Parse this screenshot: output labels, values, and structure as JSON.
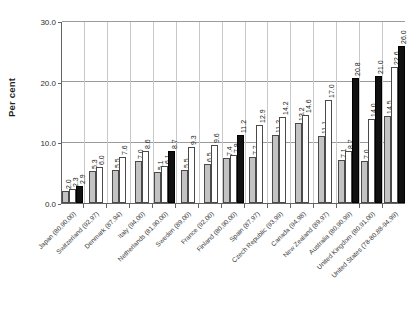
{
  "chart_data": {
    "type": "bar",
    "title": "",
    "xlabel": "",
    "ylabel": "Per cent",
    "ylim": [
      0,
      30
    ],
    "yticks": [
      "0.0",
      "10.0",
      "20.0",
      "30.0"
    ],
    "grid": true,
    "legend": "none",
    "categories": [
      "Japan (80,90,00)",
      "Switzerland (92,97)",
      "Denmark (87,94)",
      "Italy (94,00)",
      "Netherlands (81,90,00)",
      "Sweden (89,00)",
      "France (92,00)",
      "Finland (80,90,00)",
      "Spain (87,97)",
      "Czech Republic (93,99)",
      "Canada (94,98)",
      "New Zealand (89,97)",
      "Australia (80,90,99)",
      "United Kingdom (80,91,00)",
      "United States (78-80,88-94,99)"
    ],
    "groups": [
      {
        "category": "Japan (80,90,00)",
        "bars": [
          {
            "style": "gray",
            "value": 2.0
          },
          {
            "style": "white",
            "value": 2.3
          },
          {
            "style": "black",
            "value": 2.9
          }
        ]
      },
      {
        "category": "Switzerland (92,97)",
        "bars": [
          {
            "style": "gray",
            "value": 5.3
          },
          {
            "style": "white",
            "value": 6.0
          }
        ]
      },
      {
        "category": "Denmark (87,94)",
        "bars": [
          {
            "style": "gray",
            "value": 5.5
          },
          {
            "style": "white",
            "value": 7.6
          }
        ]
      },
      {
        "category": "Italy (94,00)",
        "bars": [
          {
            "style": "gray",
            "value": 7.0
          },
          {
            "style": "white",
            "value": 8.6
          }
        ]
      },
      {
        "category": "Netherlands (81,90,00)",
        "bars": [
          {
            "style": "gray",
            "value": 5.1
          },
          {
            "style": "white",
            "value": 6.1
          },
          {
            "style": "black",
            "value": 8.7
          }
        ]
      },
      {
        "category": "Sweden (89,00)",
        "bars": [
          {
            "style": "gray",
            "value": 5.5
          },
          {
            "style": "white",
            "value": 9.3
          }
        ]
      },
      {
        "category": "France (92,00)",
        "bars": [
          {
            "style": "gray",
            "value": 6.5
          },
          {
            "style": "white",
            "value": 9.6
          }
        ]
      },
      {
        "category": "Finland (80,90,00)",
        "bars": [
          {
            "style": "gray",
            "value": 7.4
          },
          {
            "style": "white",
            "value": 7.9
          },
          {
            "style": "black",
            "value": 11.2
          }
        ]
      },
      {
        "category": "Spain (87,97)",
        "bars": [
          {
            "style": "gray",
            "value": 7.7
          },
          {
            "style": "white",
            "value": 12.9
          }
        ]
      },
      {
        "category": "Czech Republic (93,99)",
        "bars": [
          {
            "style": "gray",
            "value": 11.2
          },
          {
            "style": "white",
            "value": 14.2
          }
        ]
      },
      {
        "category": "Canada (94,98)",
        "bars": [
          {
            "style": "gray",
            "value": 13.2
          },
          {
            "style": "white",
            "value": 14.6
          }
        ]
      },
      {
        "category": "New Zealand (89,97)",
        "bars": [
          {
            "style": "gray",
            "value": 11.1
          },
          {
            "style": "white",
            "value": 17.0
          }
        ]
      },
      {
        "category": "Australia (80,90,99)",
        "bars": [
          {
            "style": "gray",
            "value": 7.1
          },
          {
            "style": "white",
            "value": 8.7
          },
          {
            "style": "black",
            "value": 20.8
          }
        ]
      },
      {
        "category": "United Kingdom (80,91,00)",
        "bars": [
          {
            "style": "gray",
            "value": 7.0
          },
          {
            "style": "white",
            "value": 14.0
          },
          {
            "style": "black",
            "value": 21.0
          }
        ]
      },
      {
        "category": "United States (78-80,88-94,99)",
        "bars": [
          {
            "style": "gray",
            "value": 14.5
          },
          {
            "style": "white",
            "value": 22.6
          },
          {
            "style": "black",
            "value": 26.0
          }
        ]
      }
    ]
  }
}
